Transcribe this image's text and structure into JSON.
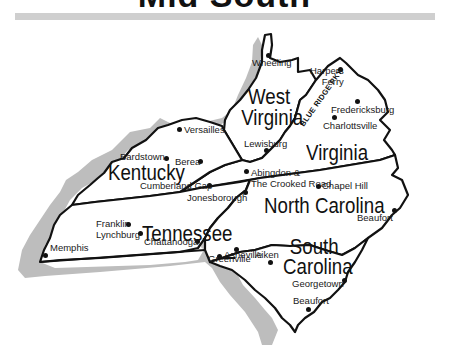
{
  "header": {
    "title": "Mid South"
  },
  "map": {
    "states": [
      {
        "name": "West Virginia",
        "line1": "West",
        "line2": "Virginia"
      },
      {
        "name": "Virginia",
        "line1": "Virginia"
      },
      {
        "name": "Kentucky",
        "line1": "Kentucky"
      },
      {
        "name": "Tennessee",
        "line1": "Tennessee"
      },
      {
        "name": "North Carolina",
        "line1": "North Carolina"
      },
      {
        "name": "South Carolina",
        "line1": "South",
        "line2": "Carolina"
      }
    ],
    "cities": [
      {
        "name": "Wheeling",
        "state": "West Virginia"
      },
      {
        "name": "Harpers Ferry",
        "line1": "Harpers",
        "line2": "Ferry",
        "state": "West Virginia"
      },
      {
        "name": "Lewisburg",
        "state": "West Virginia"
      },
      {
        "name": "Fredericksburg",
        "state": "Virginia"
      },
      {
        "name": "Charlottsville",
        "state": "Virginia"
      },
      {
        "name": "Abingdon & The Crooked Road",
        "line1": "Abingdon &",
        "line2": "The Crooked Road",
        "state": "Virginia"
      },
      {
        "name": "Versailles",
        "state": "Kentucky"
      },
      {
        "name": "Bardstown",
        "state": "Kentucky"
      },
      {
        "name": "Berea",
        "state": "Kentucky"
      },
      {
        "name": "Cumberland Gap",
        "state": "Kentucky"
      },
      {
        "name": "Jonesborough",
        "state": "Tennessee"
      },
      {
        "name": "Franklin",
        "state": "Tennessee"
      },
      {
        "name": "Lynchburg",
        "state": "Tennessee"
      },
      {
        "name": "Chattanooga",
        "state": "Tennessee"
      },
      {
        "name": "Memphis",
        "state": "Tennessee"
      },
      {
        "name": "Asheville",
        "state": "North Carolina"
      },
      {
        "name": "Chapel Hill",
        "state": "North Carolina"
      },
      {
        "name": "Beaufort",
        "state": "North Carolina"
      },
      {
        "name": "Greenville",
        "state": "South Carolina"
      },
      {
        "name": "Aiken",
        "state": "South Carolina"
      },
      {
        "name": "Georgetown",
        "state": "South Carolina"
      },
      {
        "name": "Beaufort",
        "state": "South Carolina"
      }
    ],
    "routes": [
      {
        "name": "Blue Ridge Pkwy",
        "label": "BLUE RIDGE PKY."
      }
    ],
    "colors": {
      "outline": "#111111",
      "shadow": "#bdbdbd",
      "parkway": "#c8c8c8",
      "fill": "#ffffff"
    }
  }
}
